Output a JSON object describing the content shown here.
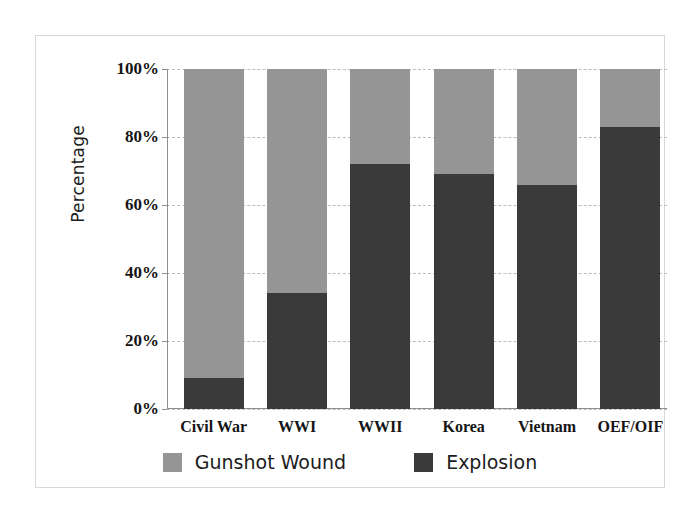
{
  "figure": {
    "background_color": "#ffffff",
    "frame_color": "#d8d8d8"
  },
  "chart_data": {
    "type": "bar",
    "subtype": "stacked-100-percent",
    "title": "",
    "subtitle": "",
    "xlabel": "",
    "ylabel": "Percentage",
    "categories": [
      "Civil War",
      "WWI",
      "WWII",
      "Korea",
      "Vietnam",
      "OEF/OIF"
    ],
    "series": [
      {
        "name": "Gunshot Wound",
        "color": "#959595",
        "values": [
          91,
          66,
          28,
          31,
          34,
          17
        ]
      },
      {
        "name": "Explosion",
        "color": "#3a3a3a",
        "values": [
          9,
          34,
          72,
          69,
          66,
          83
        ]
      }
    ],
    "ylim": [
      0,
      100
    ],
    "ytick_values": [
      0,
      20,
      40,
      60,
      80,
      100
    ],
    "ytick_labels": [
      "0%",
      "20%",
      "40%",
      "60%",
      "80%",
      "100%"
    ],
    "grid": true,
    "grid_style": "dashed",
    "grid_axis": "y",
    "legend_position": "bottom",
    "stack_order_bottom_to_top": [
      "Explosion",
      "Gunshot Wound"
    ],
    "annotations": []
  },
  "legend": {
    "items": [
      {
        "label": "Gunshot Wound",
        "color": "#959595"
      },
      {
        "label": "Explosion",
        "color": "#3a3a3a"
      }
    ]
  }
}
